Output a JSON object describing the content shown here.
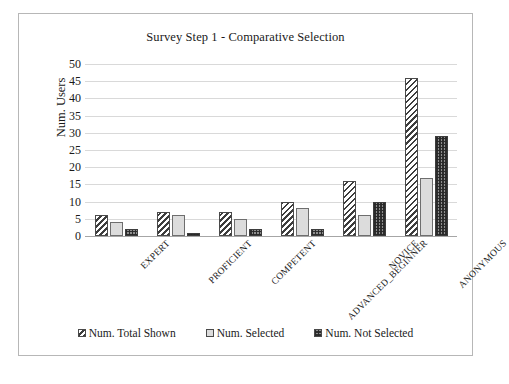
{
  "chart_data": {
    "type": "bar",
    "title": "Survey Step 1 - Comparative Selection",
    "xlabel": "",
    "ylabel": "Num. Users",
    "ylim": [
      0,
      50
    ],
    "ytick_step": 5,
    "yticks": [
      "50",
      "45",
      "40",
      "35",
      "30",
      "25",
      "20",
      "15",
      "10",
      "5",
      "0"
    ],
    "grid": true,
    "legend_position": "bottom",
    "categories": [
      "EXPERT",
      "PROFICIENT",
      "COMPETENT",
      "ADVANCED_BEGINNER",
      "NOVICE",
      "ANONYMOUS"
    ],
    "series": [
      {
        "name": "Num. Total Shown",
        "pattern": "diagonal-hatch",
        "color": "#3d3d3d",
        "values": [
          6,
          7,
          7,
          10,
          16,
          46
        ]
      },
      {
        "name": "Num. Selected",
        "pattern": "solid-light",
        "color": "#dcdcdc",
        "values": [
          4,
          6,
          5,
          8,
          6,
          17
        ]
      },
      {
        "name": "Num. Not Selected",
        "pattern": "checker-dark",
        "color": "#8e8e8e",
        "values": [
          2,
          1,
          2,
          2,
          10,
          29
        ]
      }
    ]
  },
  "frame": {
    "border_color": "#b7b7b7",
    "background": "#ffffff"
  }
}
